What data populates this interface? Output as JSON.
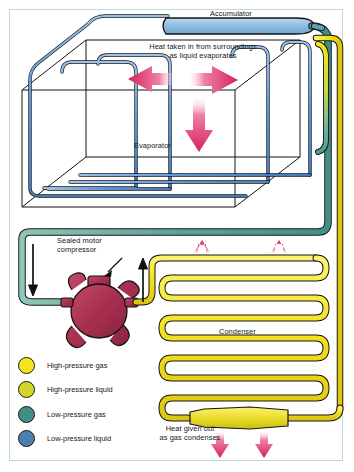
{
  "diagram": {
    "title_labels": {
      "accumulator": "Accumulator",
      "evaporator": "Evaporator",
      "condenser": "Condenser",
      "compressor_line1": "Sealed motor",
      "compressor_line2": "compressor"
    },
    "annotations": {
      "heat_in_line1": "Heat taken in from surroundings",
      "heat_in_line2": "as liquid evaporates",
      "heat_out_line1": "Heat given out",
      "heat_out_line2": "as gas condenses"
    }
  },
  "legend": {
    "items": [
      {
        "label": "High-pressure gas",
        "color": "#f5e31d"
      },
      {
        "label": "High-pressure liquid",
        "color": "#d3d62a"
      },
      {
        "label": "Low-pressure gas",
        "color": "#3f8f86"
      },
      {
        "label": "Low-pressure liquid",
        "color": "#4a7fb0"
      }
    ]
  },
  "colors": {
    "high_pressure_gas": "#f5e31d",
    "high_pressure_liquid": "#d3d62a",
    "low_pressure_gas": "#3f8f86",
    "low_pressure_liquid": "#4a7fb0",
    "evaporator_coil": "#5b92d6",
    "compressor_body": "#a8304f",
    "heat_arrow": "#d6215c",
    "frame_border": "#b9dcd8",
    "outline": "#141414",
    "background": "#ffffff"
  }
}
